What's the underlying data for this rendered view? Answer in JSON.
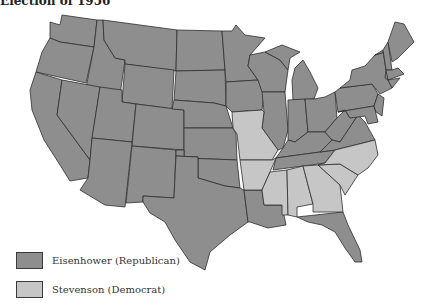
{
  "title": "Election of 1956",
  "colors": {
    "republican": "#8e8e8e",
    "democrat": "#c6c6c6",
    "border": "#2f2f2f",
    "background": "#ffffff"
  },
  "legend": [
    {
      "label": "Eisenhower (Republican)",
      "party": "republican",
      "color": "#8e8e8e"
    },
    {
      "label": "Stevenson (Democrat)",
      "party": "democrat",
      "color": "#c6c6c6"
    }
  ],
  "map": {
    "region": "United States (contiguous 48 states)",
    "states_democrat": [
      "Missouri",
      "Arkansas",
      "Mississippi",
      "Alabama",
      "Georgia",
      "South Carolina",
      "North Carolina"
    ],
    "states_republican_note": "All other contiguous states"
  }
}
